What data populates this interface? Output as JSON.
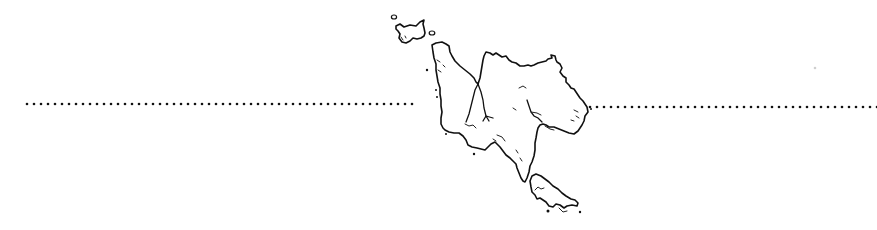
{
  "map": {
    "type": "coastline-sketch",
    "description": "Hand-drawn outline of a large island with a smaller island to the north-west and a peninsula/island to the south-east, crossed by a horizontal dotted line",
    "colors": {
      "background": "#ffffff",
      "ink": "#111111"
    },
    "dotted_line": {
      "name": "horizontal reference line (equator-like)",
      "left_segment": {
        "x_start": 27,
        "x_end": 418,
        "y": 104
      },
      "right_segment": {
        "x_start": 590,
        "x_end": 877,
        "y": 107
      },
      "dot_spacing_px": 7
    },
    "features": [
      {
        "name": "north-west islet",
        "type": "island"
      },
      {
        "name": "small round islets",
        "type": "island",
        "count": 2
      },
      {
        "name": "main island",
        "type": "island"
      },
      {
        "name": "central river system",
        "type": "river"
      },
      {
        "name": "eastern river",
        "type": "river"
      },
      {
        "name": "south-east island",
        "type": "island"
      }
    ],
    "labels": []
  }
}
